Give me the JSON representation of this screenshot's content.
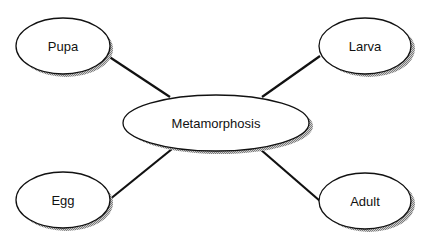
{
  "diagram": {
    "type": "concept-map",
    "center": {
      "id": "metamorphosis",
      "label": "Metamorphosis"
    },
    "nodes": [
      {
        "id": "pupa",
        "label": "Pupa"
      },
      {
        "id": "larva",
        "label": "Larva"
      },
      {
        "id": "egg",
        "label": "Egg"
      },
      {
        "id": "adult",
        "label": "Adult"
      }
    ],
    "edges": [
      {
        "from": "metamorphosis",
        "to": "pupa"
      },
      {
        "from": "metamorphosis",
        "to": "larva"
      },
      {
        "from": "metamorphosis",
        "to": "egg"
      },
      {
        "from": "metamorphosis",
        "to": "adult"
      }
    ],
    "colors": {
      "stroke": "#111111",
      "fill": "#ffffff",
      "shadow": "#9a9a9a"
    }
  }
}
